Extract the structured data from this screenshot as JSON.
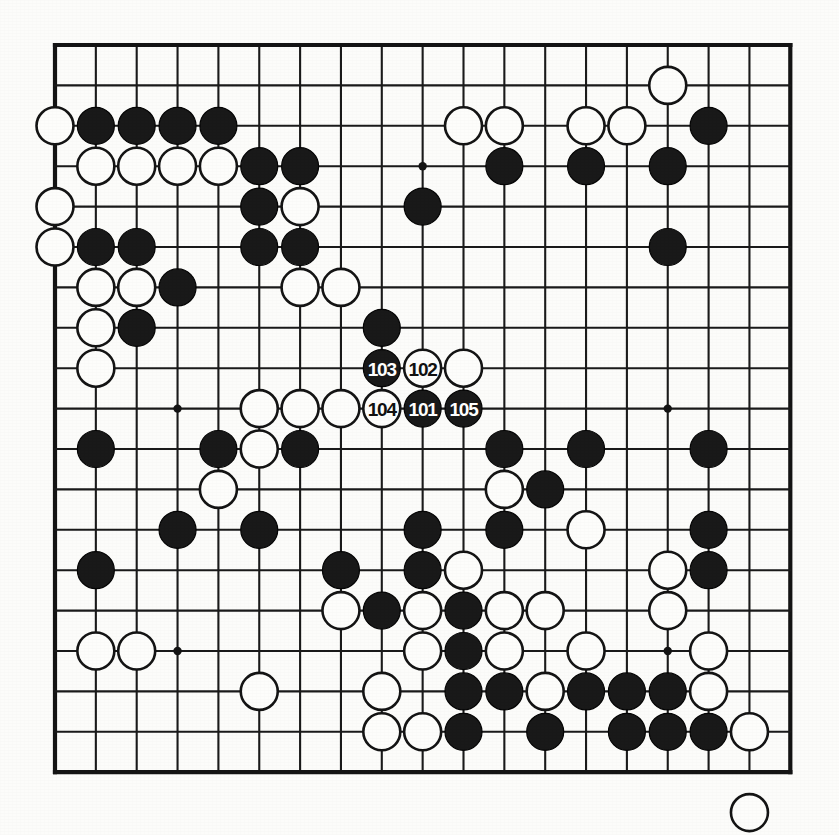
{
  "diagram": {
    "kind": "go-board-diagram",
    "board_size": 19,
    "title": "",
    "geometry": {
      "origin_x": 55,
      "origin_y": 45,
      "step_x": 40.85,
      "step_y": 40.4,
      "stone_radius": 18.5,
      "star_radius": 4.2
    },
    "colors": {
      "background": "#fcfcfa",
      "line": "#1a1a1a",
      "border": "#141414",
      "black_stone": "#191919",
      "white_stone": "#fdfdfb",
      "black_label_text": "#ffffff",
      "white_label_text": "#111111"
    },
    "star_points": [
      [
        3,
        3
      ],
      [
        9,
        3
      ],
      [
        15,
        3
      ],
      [
        3,
        9
      ],
      [
        9,
        9
      ],
      [
        15,
        9
      ],
      [
        3,
        15
      ],
      [
        9,
        15
      ],
      [
        15,
        15
      ]
    ],
    "move_numbers": [
      "101",
      "102",
      "103",
      "104",
      "105"
    ],
    "stones": [
      {
        "col": 15,
        "row": 1,
        "color": "white",
        "label": ""
      },
      {
        "col": 0,
        "row": 2,
        "color": "white",
        "label": ""
      },
      {
        "col": 1,
        "row": 2,
        "color": "black",
        "label": ""
      },
      {
        "col": 2,
        "row": 2,
        "color": "black",
        "label": ""
      },
      {
        "col": 3,
        "row": 2,
        "color": "black",
        "label": ""
      },
      {
        "col": 4,
        "row": 2,
        "color": "black",
        "label": ""
      },
      {
        "col": 10,
        "row": 2,
        "color": "white",
        "label": ""
      },
      {
        "col": 11,
        "row": 2,
        "color": "white",
        "label": ""
      },
      {
        "col": 13,
        "row": 2,
        "color": "white",
        "label": ""
      },
      {
        "col": 14,
        "row": 2,
        "color": "white",
        "label": ""
      },
      {
        "col": 16,
        "row": 2,
        "color": "black",
        "label": ""
      },
      {
        "col": 1,
        "row": 3,
        "color": "white",
        "label": ""
      },
      {
        "col": 2,
        "row": 3,
        "color": "white",
        "label": ""
      },
      {
        "col": 3,
        "row": 3,
        "color": "white",
        "label": ""
      },
      {
        "col": 4,
        "row": 3,
        "color": "white",
        "label": ""
      },
      {
        "col": 5,
        "row": 3,
        "color": "black",
        "label": ""
      },
      {
        "col": 6,
        "row": 3,
        "color": "black",
        "label": ""
      },
      {
        "col": 11,
        "row": 3,
        "color": "black",
        "label": ""
      },
      {
        "col": 13,
        "row": 3,
        "color": "black",
        "label": ""
      },
      {
        "col": 15,
        "row": 3,
        "color": "black",
        "label": ""
      },
      {
        "col": 0,
        "row": 4,
        "color": "white",
        "label": ""
      },
      {
        "col": 5,
        "row": 4,
        "color": "black",
        "label": ""
      },
      {
        "col": 6,
        "row": 4,
        "color": "white",
        "label": ""
      },
      {
        "col": 9,
        "row": 4,
        "color": "black",
        "label": ""
      },
      {
        "col": 0,
        "row": 5,
        "color": "white",
        "label": ""
      },
      {
        "col": 1,
        "row": 5,
        "color": "black",
        "label": ""
      },
      {
        "col": 2,
        "row": 5,
        "color": "black",
        "label": ""
      },
      {
        "col": 5,
        "row": 5,
        "color": "black",
        "label": ""
      },
      {
        "col": 6,
        "row": 5,
        "color": "black",
        "label": ""
      },
      {
        "col": 15,
        "row": 5,
        "color": "black",
        "label": ""
      },
      {
        "col": 1,
        "row": 6,
        "color": "white",
        "label": ""
      },
      {
        "col": 2,
        "row": 6,
        "color": "white",
        "label": ""
      },
      {
        "col": 3,
        "row": 6,
        "color": "black",
        "label": ""
      },
      {
        "col": 6,
        "row": 6,
        "color": "white",
        "label": ""
      },
      {
        "col": 7,
        "row": 6,
        "color": "white",
        "label": ""
      },
      {
        "col": 1,
        "row": 7,
        "color": "white",
        "label": ""
      },
      {
        "col": 2,
        "row": 7,
        "color": "black",
        "label": ""
      },
      {
        "col": 8,
        "row": 7,
        "color": "black",
        "label": ""
      },
      {
        "col": 1,
        "row": 8,
        "color": "white",
        "label": ""
      },
      {
        "col": 8,
        "row": 8,
        "color": "black",
        "label": "103"
      },
      {
        "col": 9,
        "row": 8,
        "color": "white",
        "label": "102"
      },
      {
        "col": 10,
        "row": 8,
        "color": "white",
        "label": ""
      },
      {
        "col": 5,
        "row": 9,
        "color": "white",
        "label": ""
      },
      {
        "col": 6,
        "row": 9,
        "color": "white",
        "label": ""
      },
      {
        "col": 7,
        "row": 9,
        "color": "white",
        "label": ""
      },
      {
        "col": 8,
        "row": 9,
        "color": "white",
        "label": "104"
      },
      {
        "col": 9,
        "row": 9,
        "color": "black",
        "label": "101"
      },
      {
        "col": 10,
        "row": 9,
        "color": "black",
        "label": "105"
      },
      {
        "col": 1,
        "row": 10,
        "color": "black",
        "label": ""
      },
      {
        "col": 4,
        "row": 10,
        "color": "black",
        "label": ""
      },
      {
        "col": 5,
        "row": 10,
        "color": "white",
        "label": ""
      },
      {
        "col": 6,
        "row": 10,
        "color": "black",
        "label": ""
      },
      {
        "col": 11,
        "row": 10,
        "color": "black",
        "label": ""
      },
      {
        "col": 13,
        "row": 10,
        "color": "black",
        "label": ""
      },
      {
        "col": 16,
        "row": 10,
        "color": "black",
        "label": ""
      },
      {
        "col": 4,
        "row": 11,
        "color": "white",
        "label": ""
      },
      {
        "col": 11,
        "row": 11,
        "color": "white",
        "label": ""
      },
      {
        "col": 12,
        "row": 11,
        "color": "black",
        "label": ""
      },
      {
        "col": 3,
        "row": 12,
        "color": "black",
        "label": ""
      },
      {
        "col": 5,
        "row": 12,
        "color": "black",
        "label": ""
      },
      {
        "col": 9,
        "row": 12,
        "color": "black",
        "label": ""
      },
      {
        "col": 11,
        "row": 12,
        "color": "black",
        "label": ""
      },
      {
        "col": 13,
        "row": 12,
        "color": "white",
        "label": ""
      },
      {
        "col": 16,
        "row": 12,
        "color": "black",
        "label": ""
      },
      {
        "col": 1,
        "row": 13,
        "color": "black",
        "label": ""
      },
      {
        "col": 7,
        "row": 13,
        "color": "black",
        "label": ""
      },
      {
        "col": 9,
        "row": 13,
        "color": "black",
        "label": ""
      },
      {
        "col": 10,
        "row": 13,
        "color": "white",
        "label": ""
      },
      {
        "col": 15,
        "row": 13,
        "color": "white",
        "label": ""
      },
      {
        "col": 16,
        "row": 13,
        "color": "black",
        "label": ""
      },
      {
        "col": 7,
        "row": 14,
        "color": "white",
        "label": ""
      },
      {
        "col": 8,
        "row": 14,
        "color": "black",
        "label": ""
      },
      {
        "col": 9,
        "row": 14,
        "color": "white",
        "label": ""
      },
      {
        "col": 10,
        "row": 14,
        "color": "black",
        "label": ""
      },
      {
        "col": 11,
        "row": 14,
        "color": "white",
        "label": ""
      },
      {
        "col": 12,
        "row": 14,
        "color": "white",
        "label": ""
      },
      {
        "col": 15,
        "row": 14,
        "color": "white",
        "label": ""
      },
      {
        "col": 1,
        "row": 15,
        "color": "white",
        "label": ""
      },
      {
        "col": 2,
        "row": 15,
        "color": "white",
        "label": ""
      },
      {
        "col": 9,
        "row": 15,
        "color": "white",
        "label": ""
      },
      {
        "col": 10,
        "row": 15,
        "color": "black",
        "label": ""
      },
      {
        "col": 11,
        "row": 15,
        "color": "white",
        "label": ""
      },
      {
        "col": 13,
        "row": 15,
        "color": "white",
        "label": ""
      },
      {
        "col": 16,
        "row": 15,
        "color": "white",
        "label": ""
      },
      {
        "col": 5,
        "row": 16,
        "color": "white",
        "label": ""
      },
      {
        "col": 8,
        "row": 16,
        "color": "white",
        "label": ""
      },
      {
        "col": 10,
        "row": 16,
        "color": "black",
        "label": ""
      },
      {
        "col": 11,
        "row": 16,
        "color": "black",
        "label": ""
      },
      {
        "col": 12,
        "row": 16,
        "color": "white",
        "label": ""
      },
      {
        "col": 13,
        "row": 16,
        "color": "black",
        "label": ""
      },
      {
        "col": 14,
        "row": 16,
        "color": "black",
        "label": ""
      },
      {
        "col": 15,
        "row": 16,
        "color": "black",
        "label": ""
      },
      {
        "col": 16,
        "row": 16,
        "color": "white",
        "label": ""
      },
      {
        "col": 8,
        "row": 17,
        "color": "white",
        "label": ""
      },
      {
        "col": 9,
        "row": 17,
        "color": "white",
        "label": ""
      },
      {
        "col": 10,
        "row": 17,
        "color": "black",
        "label": ""
      },
      {
        "col": 12,
        "row": 17,
        "color": "black",
        "label": ""
      },
      {
        "col": 14,
        "row": 17,
        "color": "black",
        "label": ""
      },
      {
        "col": 15,
        "row": 17,
        "color": "black",
        "label": ""
      },
      {
        "col": 16,
        "row": 17,
        "color": "black",
        "label": ""
      },
      {
        "col": 17,
        "row": 17,
        "color": "white",
        "label": ""
      },
      {
        "col": 17,
        "row": 19,
        "color": "white",
        "label": ""
      }
    ]
  }
}
